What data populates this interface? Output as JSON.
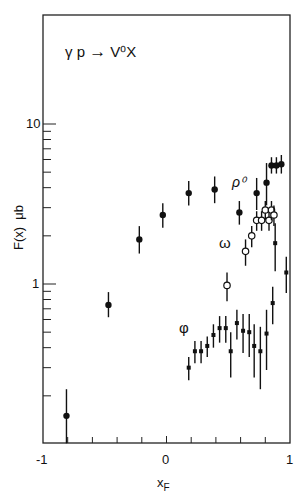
{
  "chart_data": {
    "type": "scatter",
    "title": "γ p → V⁰X",
    "xlabel": "x_F",
    "ylabel": "F(x)  μb",
    "xlim": [
      -1,
      1
    ],
    "ylim": [
      0.1,
      48
    ],
    "yscale": "log",
    "x_ticks": [
      "-1",
      "0",
      "1"
    ],
    "y_ticks": [
      "1",
      "10"
    ],
    "grid": false,
    "legend": "inline labels",
    "series": [
      {
        "name": "ρ⁰",
        "marker": "filled-circle",
        "x": [
          -0.81,
          -0.47,
          -0.22,
          -0.03,
          0.18,
          0.39,
          0.59,
          0.73,
          0.81,
          0.85,
          0.89,
          0.93
        ],
        "y": [
          0.15,
          0.74,
          1.9,
          2.7,
          3.7,
          3.9,
          2.8,
          3.7,
          4.3,
          5.5,
          5.5,
          5.6
        ],
        "err_lo": [
          0.06,
          0.12,
          0.35,
          0.45,
          0.6,
          0.7,
          0.45,
          0.8,
          1.2,
          0.6,
          0.6,
          0.7
        ],
        "err_hi": [
          0.07,
          0.15,
          0.4,
          0.5,
          0.7,
          0.8,
          0.5,
          0.9,
          1.4,
          0.7,
          0.7,
          0.8
        ]
      },
      {
        "name": "ω",
        "marker": "open-circle",
        "x": [
          0.49,
          0.64,
          0.69,
          0.73,
          0.77,
          0.8,
          0.83,
          0.85,
          0.87
        ],
        "y": [
          0.98,
          1.6,
          2.0,
          2.5,
          2.5,
          2.9,
          2.5,
          2.9,
          2.7
        ],
        "err_lo": [
          0.2,
          0.3,
          0.3,
          0.35,
          0.35,
          0.4,
          0.35,
          0.4,
          0.4
        ],
        "err_hi": [
          0.2,
          0.3,
          0.3,
          0.35,
          0.35,
          0.4,
          0.35,
          0.4,
          0.4
        ]
      },
      {
        "name": "φ",
        "marker": "cross",
        "x": [
          0.18,
          0.23,
          0.28,
          0.33,
          0.38,
          0.43,
          0.48,
          0.52,
          0.57,
          0.62,
          0.67,
          0.71,
          0.76,
          0.81,
          0.86,
          0.88,
          0.97
        ],
        "y": [
          0.3,
          0.38,
          0.38,
          0.41,
          0.48,
          0.53,
          0.53,
          0.38,
          0.57,
          0.51,
          0.5,
          0.41,
          0.38,
          0.49,
          0.76,
          1.8,
          1.18
        ],
        "err_lo": [
          0.05,
          0.06,
          0.06,
          0.06,
          0.08,
          0.1,
          0.1,
          0.12,
          0.12,
          0.14,
          0.15,
          0.15,
          0.16,
          0.2,
          0.2,
          0.6,
          0.3
        ],
        "err_hi": [
          0.05,
          0.06,
          0.06,
          0.06,
          0.08,
          0.1,
          0.1,
          0.12,
          0.12,
          0.14,
          0.15,
          0.15,
          0.16,
          0.2,
          0.2,
          0.6,
          0.3
        ]
      }
    ]
  },
  "labels": {
    "title_main": "γ p",
    "title_arrow": "→",
    "title_product": "V⁰X",
    "ylabel": "F(x)  μb",
    "xlabel": "x",
    "xlabel_sub": "F",
    "series_rho": "ρ⁰",
    "series_omega": "ω",
    "series_phi": "φ",
    "x_tick_min": "-1",
    "x_tick_mid": "0",
    "x_tick_max": "1",
    "y_tick_1": "1",
    "y_tick_10": "10"
  }
}
